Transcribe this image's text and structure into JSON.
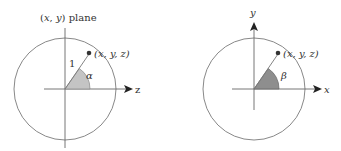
{
  "colors": {
    "stroke": "#7a7a7a",
    "axis": "#555555",
    "text": "#333333",
    "point": "#333333",
    "wedge_left": "#c4c4c4",
    "wedge_right": "#8e8e8e"
  },
  "left_diagram": {
    "title": "(x, y) plane",
    "title_parts": [
      "(",
      "x",
      ", ",
      "y",
      ") plane"
    ],
    "axis_label": "z",
    "point_label": "(x, y, z)",
    "radius_label": "1",
    "angle_label": "α"
  },
  "right_diagram": {
    "vertical_axis_label": "y",
    "horizontal_axis_label": "x",
    "point_label": "(x, y, z)",
    "angle_label": "β"
  }
}
